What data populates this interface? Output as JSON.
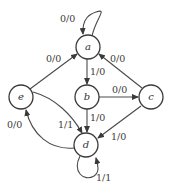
{
  "diagram": {
    "type": "finite-state-machine",
    "nodes": [
      {
        "id": "a",
        "label": "a"
      },
      {
        "id": "b",
        "label": "b"
      },
      {
        "id": "c",
        "label": "c"
      },
      {
        "id": "d",
        "label": "d"
      },
      {
        "id": "e",
        "label": "e"
      }
    ],
    "edges": [
      {
        "from": "a",
        "to": "a",
        "label": "0/0"
      },
      {
        "from": "a",
        "to": "b",
        "label": "1/0"
      },
      {
        "from": "e",
        "to": "a",
        "label": "0/0"
      },
      {
        "from": "c",
        "to": "a",
        "label": "0/0"
      },
      {
        "from": "b",
        "to": "c",
        "label": "0/0"
      },
      {
        "from": "b",
        "to": "d",
        "label": "1/0"
      },
      {
        "from": "c",
        "to": "d",
        "label": "1/0"
      },
      {
        "from": "e",
        "to": "d",
        "label": "1/1"
      },
      {
        "from": "d",
        "to": "e",
        "label": "0/0"
      },
      {
        "from": "d",
        "to": "d",
        "label": "1/1"
      }
    ]
  }
}
